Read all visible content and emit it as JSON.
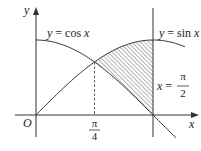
{
  "diagram": {
    "colors": {
      "stroke": "#333333",
      "hatch": "#555555",
      "background": "#ffffff"
    },
    "axes": {
      "x_label": "x",
      "y_label": "y",
      "origin_label": "O"
    },
    "curves": [
      {
        "id": "cos",
        "label_lhs": "y",
        "label_eq": " = cos ",
        "label_var": "x"
      },
      {
        "id": "sin",
        "label_lhs": "y",
        "label_eq": " = sin ",
        "label_var": "x"
      }
    ],
    "vertical_line": {
      "label_var": "x",
      "label_eq": " = ",
      "numerator": "π",
      "denominator": "2"
    },
    "tick": {
      "numerator": "π",
      "denominator": "4"
    },
    "shaded_region": "between sin x (top) and cos x (bottom) from π/4 to π/2"
  }
}
